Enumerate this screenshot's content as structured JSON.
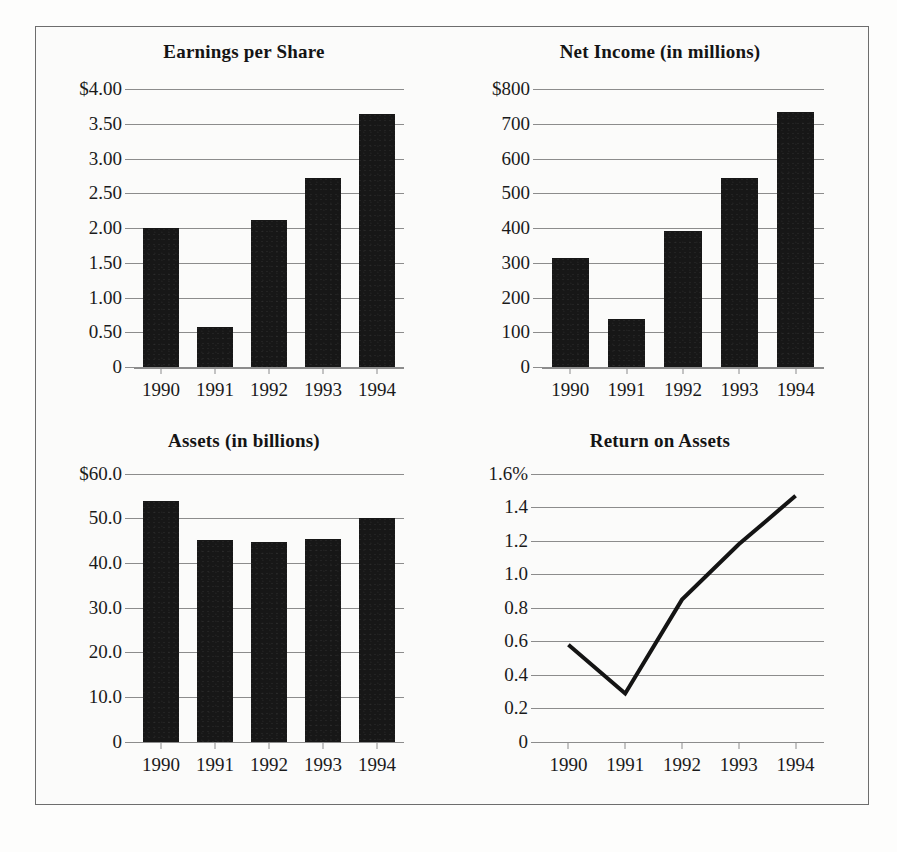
{
  "figure": {
    "background_color": "#fbfbfa",
    "border_color": "#6d6d6d",
    "bar_color": "#171717",
    "grid_color": "#8c8c8c",
    "line_color": "#141414"
  },
  "panels": [
    {
      "title": "Earnings per Share"
    },
    {
      "title": "Net Income (in millions)"
    },
    {
      "title": "Assets (in billions)"
    },
    {
      "title": "Return on Assets"
    }
  ],
  "chart_data": [
    {
      "type": "bar",
      "title": "Earnings per Share",
      "xlabel": "",
      "ylabel": "",
      "categories": [
        "1990",
        "1991",
        "1992",
        "1993",
        "1994"
      ],
      "values": [
        2.0,
        0.58,
        2.11,
        2.72,
        3.64
      ],
      "ytick_labels": [
        "$4.00",
        "3.50",
        "3.00",
        "2.50",
        "2.00",
        "1.50",
        "1.00",
        "0.50",
        "0"
      ],
      "ytick_values": [
        4.0,
        3.5,
        3.0,
        2.5,
        2.0,
        1.5,
        1.0,
        0.5,
        0
      ],
      "ylim": [
        0,
        4.0
      ],
      "grid": true,
      "legend": "none"
    },
    {
      "type": "bar",
      "title": "Net Income (in millions)",
      "xlabel": "",
      "ylabel": "",
      "categories": [
        "1990",
        "1991",
        "1992",
        "1993",
        "1994"
      ],
      "values": [
        315,
        137,
        390,
        545,
        735
      ],
      "ytick_labels": [
        "$800",
        "700",
        "600",
        "500",
        "400",
        "300",
        "200",
        "100",
        "0"
      ],
      "ytick_values": [
        800,
        700,
        600,
        500,
        400,
        300,
        200,
        100,
        0
      ],
      "ylim": [
        0,
        800
      ],
      "grid": true,
      "legend": "none"
    },
    {
      "type": "bar",
      "title": "Assets (in billions)",
      "xlabel": "",
      "ylabel": "",
      "categories": [
        "1990",
        "1991",
        "1992",
        "1993",
        "1994"
      ],
      "values": [
        53.8,
        45.2,
        44.7,
        45.4,
        50.1
      ],
      "ytick_labels": [
        "$60.0",
        "50.0",
        "40.0",
        "30.0",
        "20.0",
        "10.0",
        "0"
      ],
      "ytick_values": [
        60.0,
        50.0,
        40.0,
        30.0,
        20.0,
        10.0,
        0
      ],
      "ylim": [
        0,
        60.0
      ],
      "grid": true,
      "legend": "none"
    },
    {
      "type": "line",
      "title": "Return on Assets",
      "xlabel": "",
      "ylabel": "",
      "categories": [
        "1990",
        "1991",
        "1992",
        "1993",
        "1994"
      ],
      "values": [
        0.58,
        0.29,
        0.85,
        1.18,
        1.47
      ],
      "ytick_labels": [
        "1.6%",
        "1.4",
        "1.2",
        "1.0",
        "0.8",
        "0.6",
        "0.4",
        "0.2",
        "0"
      ],
      "ytick_values": [
        1.6,
        1.4,
        1.2,
        1.0,
        0.8,
        0.6,
        0.4,
        0.2,
        0
      ],
      "ylim": [
        0,
        1.6
      ],
      "grid": true,
      "legend": "none"
    }
  ]
}
